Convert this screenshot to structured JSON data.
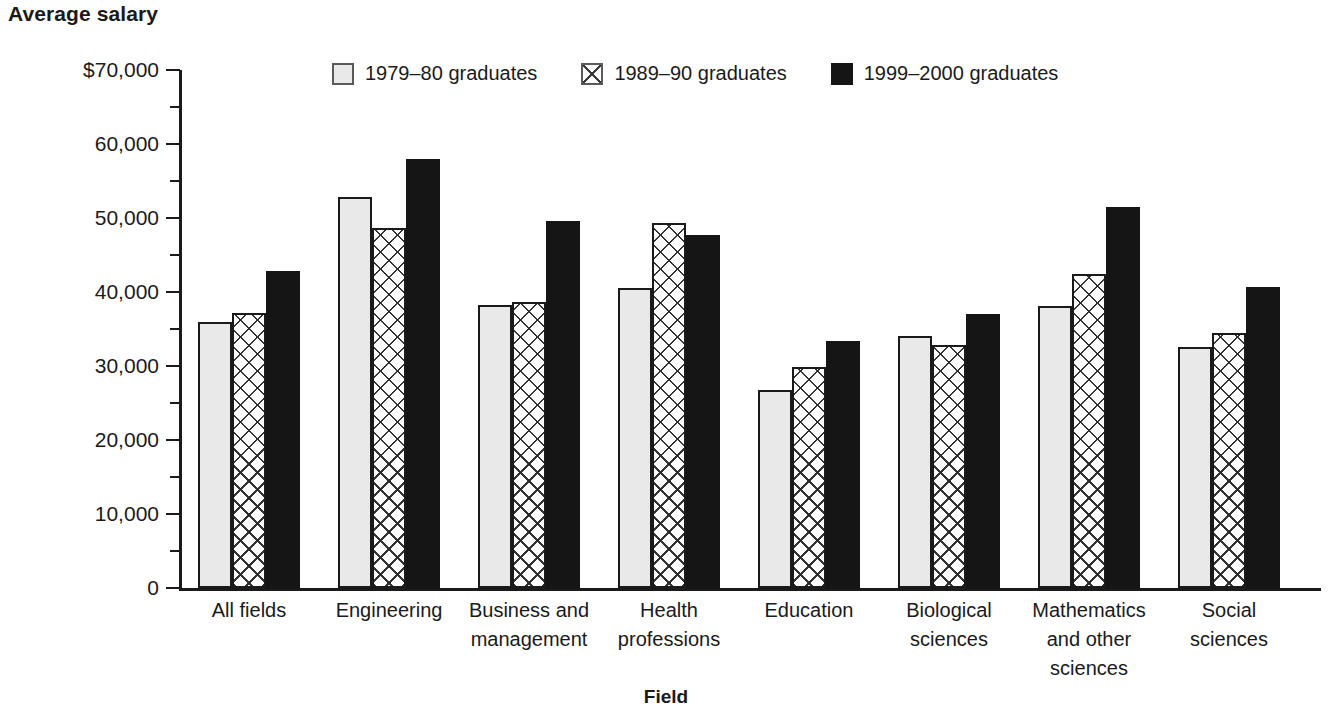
{
  "chart_data": {
    "type": "bar",
    "title": "",
    "ylabel": "Average salary",
    "xlabel": "Field",
    "ylim": [
      0,
      70000
    ],
    "grid": false,
    "legend_position": "top-center",
    "ytick_labels": [
      "$70,000",
      "60,000",
      "50,000",
      "40,000",
      "30,000",
      "20,000",
      "10,000",
      "0"
    ],
    "ytick_values": [
      70000,
      60000,
      50000,
      40000,
      30000,
      20000,
      10000,
      0
    ],
    "minor_tick_values": [
      65000,
      55000,
      45000,
      35000,
      25000,
      15000,
      5000
    ],
    "categories": [
      "All fields",
      "Engineering",
      "Business and\nmanagement",
      "Health\nprofessions",
      "Education",
      "Biological\nsciences",
      "Mathematics\nand other\nsciences",
      "Social\nsciences"
    ],
    "series": [
      {
        "name": "1979–80 graduates",
        "pattern": "light-gray-solid",
        "color": "#e9e9e9",
        "values": [
          35900,
          52900,
          38300,
          40600,
          26800,
          34000,
          38100,
          32600
        ]
      },
      {
        "name": "1989–90 graduates",
        "pattern": "crosshatch",
        "color": "#ffffff",
        "values": [
          37200,
          48600,
          38700,
          49300,
          29800,
          32900,
          42400,
          34500
        ]
      },
      {
        "name": "1999–2000 graduates",
        "pattern": "solid-black",
        "color": "#151515",
        "values": [
          42900,
          58000,
          49600,
          47700,
          33400,
          37000,
          51500,
          40700
        ]
      }
    ]
  },
  "axis_titles": {
    "y": "Average salary",
    "x": "Field"
  },
  "legend": {
    "items": [
      {
        "label": "1979–80 graduates",
        "swatch": "light-gray-square-icon"
      },
      {
        "label": "1989–90 graduates",
        "swatch": "crosshatch-square-icon"
      },
      {
        "label": "1999–2000 graduates",
        "swatch": "black-square-icon"
      }
    ]
  }
}
